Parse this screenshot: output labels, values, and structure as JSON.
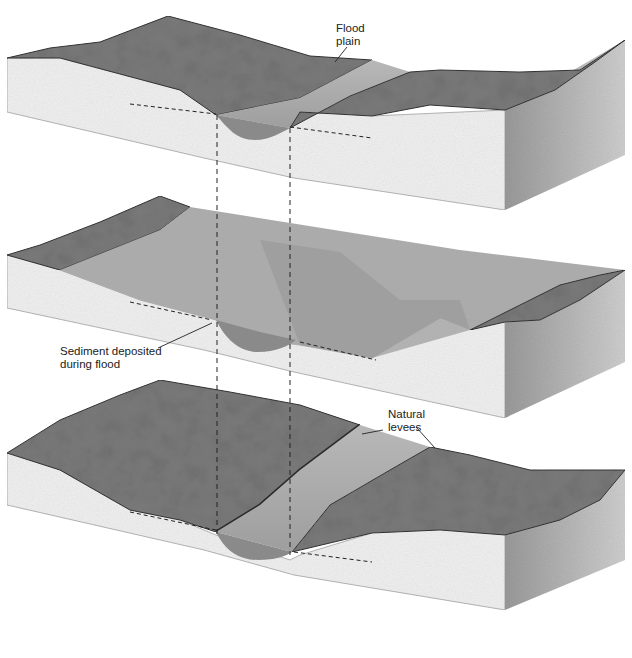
{
  "figure": {
    "panels": [
      {
        "id": "before-flood",
        "state": "Normal channel flow"
      },
      {
        "id": "during-flood",
        "state": "Flood covering flood plain"
      },
      {
        "id": "after-flood",
        "state": "Natural levees formed"
      }
    ],
    "labels": {
      "flood_plain_line1": "Flood",
      "flood_plain_line2": "plain",
      "sediment_line1": "Sediment deposited",
      "sediment_line2": "during flood",
      "levees_line1": "Natural",
      "levees_line2": "levees"
    },
    "colors": {
      "land_surface": "#7a7a7a",
      "water": "#a9a9a9",
      "water_deep": "#8c8c8c",
      "front_face": "#efefef",
      "side_face": "#bdbdbd",
      "outline": "#333333"
    }
  }
}
